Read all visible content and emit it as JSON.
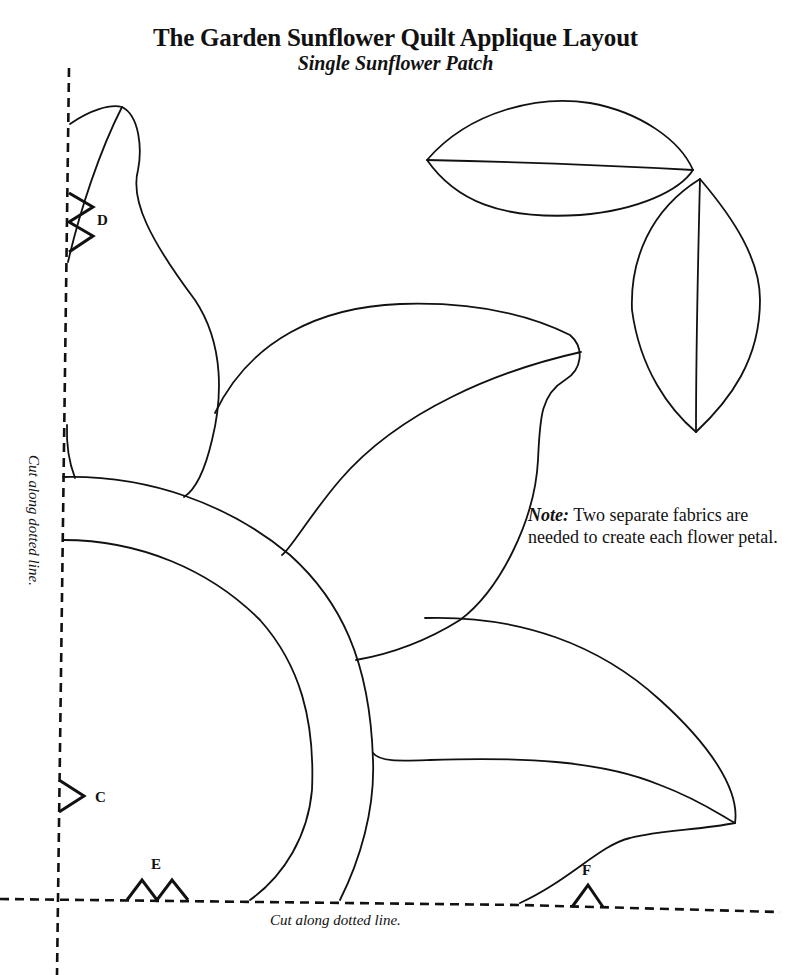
{
  "header": {
    "title": "The Garden Sunflower Quilt Applique Layout",
    "subtitle": "Single Sunflower Patch"
  },
  "note": {
    "label": "Note:",
    "text": "Two separate fabrics are needed to create each flower petal."
  },
  "cut_instructions": {
    "bottom": "Cut along dotted line.",
    "left": "Cut along dotted line."
  },
  "placement_marks": {
    "C": "C",
    "D": "D",
    "E": "E",
    "F": "F"
  },
  "colors": {
    "ink": "#111111",
    "paper": "#ffffff"
  }
}
